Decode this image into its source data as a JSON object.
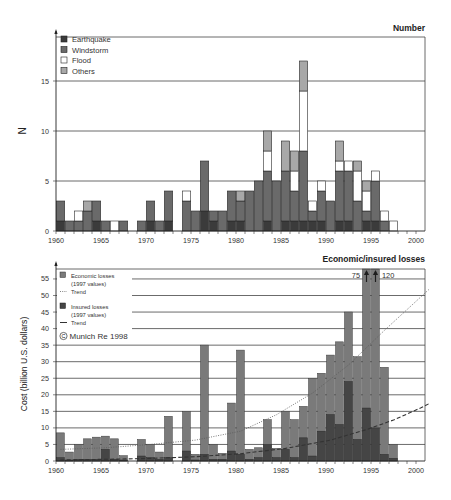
{
  "chart_data": [
    {
      "type": "bar",
      "stacked": true,
      "title": "Number",
      "xlabel": "",
      "ylabel": "N",
      "ylim": [
        0,
        19.4
      ],
      "yticks": [
        0,
        5,
        10,
        15
      ],
      "grid": true,
      "x_start": 1960,
      "x_range": [
        1960,
        2000
      ],
      "xticks": [
        1960,
        1965,
        1970,
        1975,
        1980,
        1985,
        1990,
        1995,
        2000
      ],
      "legend_position": "upper-left",
      "years": [
        1960,
        1961,
        1962,
        1963,
        1964,
        1965,
        1966,
        1967,
        1968,
        1969,
        1970,
        1971,
        1972,
        1973,
        1974,
        1975,
        1976,
        1977,
        1978,
        1979,
        1980,
        1981,
        1982,
        1983,
        1984,
        1985,
        1986,
        1987,
        1988,
        1989,
        1990,
        1991,
        1992,
        1993,
        1994,
        1995,
        1996,
        1997
      ],
      "series": [
        {
          "name": "Earthquake",
          "color": "#3b3b3b",
          "values": [
            1,
            0,
            0,
            0,
            1,
            0,
            0,
            0,
            0,
            0,
            1,
            0,
            1,
            0,
            0,
            0,
            2,
            1,
            0,
            1,
            1,
            0,
            0,
            1,
            0,
            1,
            1,
            1,
            1,
            1,
            0,
            1,
            1,
            0,
            1,
            1,
            0,
            0
          ]
        },
        {
          "name": "Windstorm",
          "color": "#6a6a6a",
          "values": [
            2,
            1,
            1,
            2,
            2,
            1,
            0,
            1,
            0,
            1,
            2,
            1,
            3,
            0,
            3,
            2,
            5,
            1,
            2,
            3,
            2,
            4,
            5,
            5,
            5,
            5,
            3,
            7,
            1,
            3,
            3,
            5,
            5,
            3,
            1,
            4,
            1,
            0
          ]
        },
        {
          "name": "Flood",
          "color": "#ffffff",
          "values": [
            0,
            0,
            1,
            0,
            0,
            0,
            1,
            0,
            0,
            0,
            0,
            0,
            0,
            0,
            1,
            0,
            0,
            0,
            0,
            0,
            0,
            0,
            0,
            2,
            0,
            0,
            2,
            6,
            1,
            1,
            0,
            1,
            1,
            3,
            2,
            1,
            1,
            1
          ]
        },
        {
          "name": "Others",
          "color": "#a8a8a8",
          "values": [
            0,
            0,
            0,
            1,
            0,
            0,
            0,
            0,
            0,
            0,
            0,
            0,
            0,
            0,
            0,
            0,
            0,
            0,
            0,
            0,
            1,
            0,
            0,
            2,
            0,
            3,
            2,
            3,
            0,
            0,
            0,
            2,
            0,
            1,
            1,
            0,
            0,
            0
          ]
        }
      ]
    },
    {
      "type": "bar",
      "stacked": false,
      "title": "Economic/insured losses",
      "xlabel": "",
      "ylabel": "Cost (billion U.S. dollars)",
      "ylim": [
        0,
        58
      ],
      "yticks": [
        0,
        5,
        10,
        15,
        20,
        25,
        30,
        35,
        40,
        45,
        50,
        55
      ],
      "grid": true,
      "x_start": 1960,
      "x_range": [
        1960,
        2000
      ],
      "xticks": [
        1960,
        1965,
        1970,
        1975,
        1980,
        1985,
        1990,
        1995,
        2000
      ],
      "legend_position": "upper-left",
      "years": [
        1960,
        1961,
        1962,
        1963,
        1964,
        1965,
        1966,
        1967,
        1968,
        1969,
        1970,
        1971,
        1972,
        1973,
        1974,
        1975,
        1976,
        1977,
        1978,
        1979,
        1980,
        1981,
        1982,
        1983,
        1984,
        1985,
        1986,
        1987,
        1988,
        1989,
        1990,
        1991,
        1992,
        1993,
        1994,
        1995,
        1996,
        1997
      ],
      "series": [
        {
          "name": "Economic losses (1997 values)",
          "color": "#7a7a7a",
          "values": [
            8.5,
            2.7,
            5,
            6.7,
            7.2,
            7.5,
            6.7,
            1.6,
            0,
            6.5,
            5,
            2.7,
            13.5,
            0,
            15,
            2,
            35,
            5,
            2.3,
            17.5,
            33.5,
            3.5,
            4,
            12.5,
            3.8,
            15,
            12.5,
            16.5,
            25,
            26.5,
            32,
            36,
            45,
            31.5,
            75,
            120,
            28.3,
            5
          ]
        },
        {
          "name": "Insured losses (1997 values)",
          "color": "#454545",
          "values": [
            1,
            0.3,
            0.5,
            0.5,
            0.5,
            3.5,
            0.5,
            0.3,
            0,
            1.5,
            1,
            0.5,
            1,
            0,
            3,
            0.3,
            2,
            0.5,
            0.5,
            3,
            2,
            0.5,
            1,
            5,
            1,
            3.5,
            1,
            7,
            1.5,
            9,
            14,
            11,
            24,
            6.5,
            16,
            10,
            2,
            0.8
          ]
        }
      ],
      "trends": [
        {
          "name": "Trend (economic losses)",
          "style": "dotted",
          "color": "#5a5a5a",
          "points": [
            [
              1960,
              3.5
            ],
            [
              1965,
              4
            ],
            [
              1970,
              5
            ],
            [
              1975,
              6.3
            ],
            [
              1980,
              9
            ],
            [
              1984,
              14
            ],
            [
              1988,
              20.5
            ],
            [
              1992,
              29
            ],
            [
              1996,
              39.5
            ],
            [
              2000,
              49.5
            ],
            [
              2001,
              52
            ]
          ]
        },
        {
          "name": "Trend (insured losses)",
          "style": "dashed",
          "color": "#333333",
          "points": [
            [
              1960,
              0.3
            ],
            [
              1965,
              0.5
            ],
            [
              1970,
              0.8
            ],
            [
              1975,
              1.3
            ],
            [
              1980,
              2.2
            ],
            [
              1985,
              3.8
            ],
            [
              1990,
              6.3
            ],
            [
              1994,
              9.5
            ],
            [
              1997,
              12.4
            ],
            [
              2000,
              16
            ],
            [
              2001,
              17.4
            ]
          ]
        }
      ],
      "annotations": [
        {
          "text": "75",
          "year": 1994,
          "note": "off-scale value"
        },
        {
          "text": "120",
          "year": 1995,
          "note": "off-scale value"
        }
      ],
      "legend": {
        "economic_label": "Economic losses",
        "economic_sub": "(1997 values)",
        "economic_trend": "Trend",
        "insured_label": "Insured losses",
        "insured_sub": "(1997 values)",
        "insured_trend": "Trend"
      },
      "copyright": "Munich Re 1998",
      "copyright_symbol": "C"
    }
  ]
}
